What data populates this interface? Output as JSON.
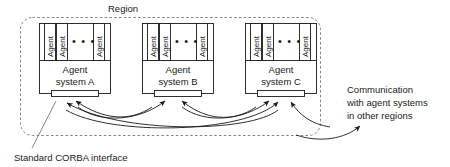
{
  "diagram": {
    "region_label": "Region",
    "ellipsis": "• • •",
    "agent_label": "Agent",
    "systems": [
      {
        "id": "a",
        "name_line1": "Agent",
        "name_line2": "system A",
        "agents": [
          "Agent",
          "Agent",
          "Agent"
        ],
        "incoming_arrows": 3
      },
      {
        "id": "b",
        "name_line1": "Agent",
        "name_line2": "system B",
        "agents": [
          "Agent",
          "Agent",
          "Agent"
        ],
        "incoming_arrows": 2
      },
      {
        "id": "c",
        "name_line1": "Agent",
        "name_line2": "system C",
        "agents": [
          "Agent",
          "Agent",
          "Agent"
        ],
        "incoming_arrows": 3
      }
    ],
    "annotations": {
      "corba_caption": "Standard CORBA interface",
      "communication_line1": "Communication",
      "communication_line2": "with agent systems",
      "communication_line3": "in other regions"
    },
    "colors": {
      "line": "#1a1a1a",
      "boundary": "#777777",
      "background": "#ffffff"
    }
  }
}
